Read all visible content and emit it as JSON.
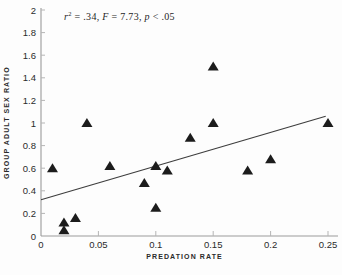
{
  "figure": {
    "background": "#fdfdfd",
    "annotation": {
      "r_var": "r",
      "r_sup": "2",
      "r_rest": " = .34, ",
      "f_var": "F",
      "f_rest": " = 7.73, ",
      "p_var": "p",
      "p_rest": " < .05"
    }
  },
  "chart_data": {
    "type": "scatter",
    "title": "",
    "annotation_text": "r² = .34, F = 7.73, p < .05",
    "xlabel": "PREDATION RATE",
    "ylabel": "GROUP ADULT SEX RATIO",
    "xlim": [
      0,
      0.25
    ],
    "ylim": [
      0,
      2
    ],
    "grid": false,
    "legend": "none",
    "marker": "filled-triangle",
    "marker_color": "#1c1c1c",
    "axis_color": "#9b9b9b",
    "tick_color": "#b5b5b5",
    "label_color": "#2b2b2b",
    "line_color": "#3d3d3d",
    "x_tick_values": [
      0,
      0.05,
      0.1,
      0.15,
      0.2,
      0.25
    ],
    "x_tick_labels": [
      "0",
      "0.05",
      "0.1",
      "0.15",
      "0.2",
      "0.25"
    ],
    "y_tick_values": [
      0,
      0.2,
      0.4,
      0.6,
      0.8,
      1,
      1.2,
      1.4,
      1.6,
      1.8,
      2
    ],
    "y_tick_labels": [
      "0",
      "0.2",
      "0.4",
      "0.6",
      "0.8",
      "1",
      "1.2",
      "1.4",
      "1.6",
      "1.8",
      "2"
    ],
    "points": [
      {
        "x": 0.01,
        "y": 0.6
      },
      {
        "x": 0.02,
        "y": 0.12
      },
      {
        "x": 0.02,
        "y": 0.05
      },
      {
        "x": 0.03,
        "y": 0.16
      },
      {
        "x": 0.04,
        "y": 1.0
      },
      {
        "x": 0.06,
        "y": 0.62
      },
      {
        "x": 0.09,
        "y": 0.47
      },
      {
        "x": 0.1,
        "y": 0.62
      },
      {
        "x": 0.1,
        "y": 0.25
      },
      {
        "x": 0.11,
        "y": 0.58
      },
      {
        "x": 0.13,
        "y": 0.87
      },
      {
        "x": 0.15,
        "y": 1.5
      },
      {
        "x": 0.15,
        "y": 1.0
      },
      {
        "x": 0.18,
        "y": 0.58
      },
      {
        "x": 0.2,
        "y": 0.68
      },
      {
        "x": 0.25,
        "y": 1.0
      }
    ],
    "regression_line": {
      "x1": 0,
      "y1": 0.32,
      "x2": 0.248,
      "y2": 1.06
    }
  }
}
